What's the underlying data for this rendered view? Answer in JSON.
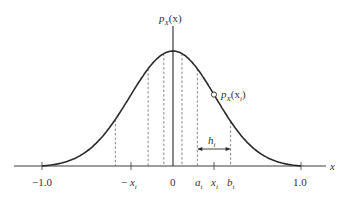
{
  "diagram": {
    "y_axis_label": {
      "base": "p",
      "sub": "X",
      "arg": "(x)"
    },
    "x_axis_label": "x",
    "curve_label": {
      "base": "p",
      "sub": "X",
      "arg": "(x",
      "arg_sub": "i",
      "close": ")"
    },
    "interval_label": {
      "base": "h",
      "sub": "i"
    },
    "tick_labels": {
      "neg_one": "−1.0",
      "neg_xi": {
        "prefix": "− ",
        "base": "x",
        "sub": "i"
      },
      "zero": "0",
      "ai": {
        "base": "a",
        "sub": "i"
      },
      "xi": {
        "base": "x",
        "sub": "i"
      },
      "bi": {
        "base": "b",
        "sub": "i"
      },
      "one": "1.0"
    },
    "x_range": [
      -1.0,
      1.0
    ],
    "dashed_lines_x": [
      -0.44,
      -0.19,
      -0.07,
      0.07,
      0.19,
      0.45
    ],
    "marker_x": 0.32,
    "interval": {
      "a": 0.19,
      "b": 0.45
    },
    "colors": {
      "curve": "#2a2a2a",
      "axis": "#3a3a3a",
      "dashed": "#555555"
    }
  }
}
